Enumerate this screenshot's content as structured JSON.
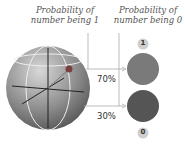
{
  "labels": {
    "prob_one": "Probability of\nnumber being 1",
    "prob_one_l1": "Probability of",
    "prob_one_l2": "number being 1",
    "prob_zero_l1": "Probability of",
    "prob_zero_l2": "number being 0",
    "pct_one": "70%",
    "pct_zero": "30%",
    "state_one": "1",
    "state_zero": "0"
  },
  "colors": {
    "sphere": "#8a8a8a",
    "state_one_circle": "#7a7a7a",
    "state_zero_circle": "#555555",
    "badge": "#cfcfcf"
  }
}
